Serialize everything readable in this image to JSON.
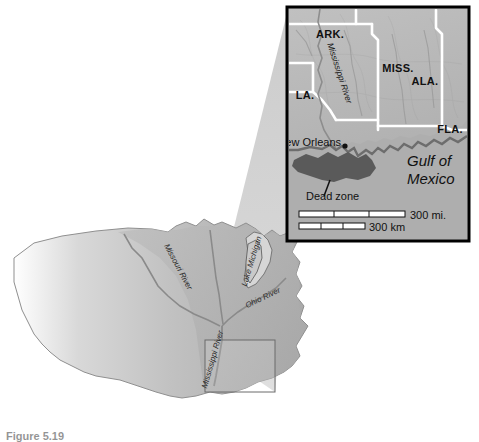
{
  "figure": {
    "caption": "Figure 5.19",
    "background_color": "#ffffff"
  },
  "main_map": {
    "name": "united-states-drainage-basin-map",
    "land_color": "#b5b5b5",
    "highlight_color": "#9d9d9d",
    "river_color": "#8a8a8a",
    "labels": [
      {
        "id": "missouri-river",
        "text": "Missouri River"
      },
      {
        "id": "ohio-river",
        "text": "Ohio River"
      },
      {
        "id": "mississippi-river",
        "text": "Mississippi River"
      },
      {
        "id": "lake-michigan",
        "text": "Lake Michigan"
      }
    ],
    "inset_locator_box": "gulf-coast-region"
  },
  "inset_map": {
    "name": "gulf-coast-dead-zone-inset",
    "frame_color": "#000000",
    "land_color": "#b9b9b9",
    "water_color": "#ababab",
    "border_color": "#ffffff",
    "dead_zone_color": "#5a5a5a",
    "states": [
      {
        "id": "arkansas",
        "text": "ARK."
      },
      {
        "id": "mississippi",
        "text": "MISS."
      },
      {
        "id": "alabama",
        "text": "ALA."
      },
      {
        "id": "louisiana",
        "text": "LA."
      },
      {
        "id": "florida",
        "text": "FLA."
      }
    ],
    "features": [
      {
        "id": "mississippi-river",
        "text": "Mississippi River"
      },
      {
        "id": "new-orleans",
        "text": "New Orleans"
      },
      {
        "id": "dead-zone",
        "text": "Dead zone"
      },
      {
        "id": "gulf-of-mexico",
        "text": "Gulf of Mexico"
      }
    ],
    "scale_bars": [
      {
        "id": "scale-miles",
        "text": "300 mi.",
        "segments": 3
      },
      {
        "id": "scale-kilometers",
        "text": "300 km",
        "segments": 3
      }
    ]
  }
}
